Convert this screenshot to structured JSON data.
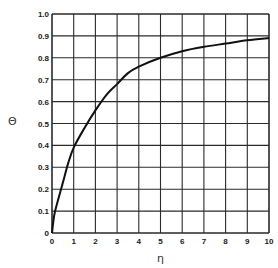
{
  "chart_data": {
    "type": "line",
    "title": "",
    "xlabel": "η",
    "ylabel": "Θ",
    "xlim": [
      0,
      10
    ],
    "ylim": [
      0,
      1.0
    ],
    "grid": true,
    "legend": null,
    "x_ticks": [
      "0",
      "1",
      "2",
      "3",
      "4",
      "5",
      "6",
      "7",
      "8",
      "9",
      "10"
    ],
    "y_ticks": [
      "0",
      "0.1",
      "0.2",
      "0.3",
      "0.4",
      "0.5",
      "0.6",
      "0.7",
      "0.8",
      "0.9",
      "1.0"
    ],
    "series": [
      {
        "name": "Θ(η)",
        "x": [
          0,
          0.1,
          0.25,
          0.5,
          0.75,
          1,
          1.5,
          2,
          2.5,
          3,
          3.5,
          4,
          5,
          6,
          7,
          8,
          9,
          10
        ],
        "y": [
          0,
          0.08,
          0.14,
          0.23,
          0.32,
          0.39,
          0.48,
          0.56,
          0.63,
          0.68,
          0.73,
          0.76,
          0.8,
          0.83,
          0.85,
          0.865,
          0.88,
          0.89
        ]
      }
    ]
  },
  "labels": {
    "x_axis": "η",
    "y_axis": "Θ"
  },
  "colors": {
    "grid": "#2a2a2a",
    "curve": "#111111",
    "background": "#ffffff"
  }
}
